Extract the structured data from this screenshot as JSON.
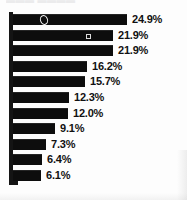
{
  "chart_data": {
    "type": "bar",
    "orientation": "horizontal",
    "title": "",
    "subtitle": "",
    "xlabel": "",
    "ylabel": "",
    "grid": false,
    "legend": null,
    "axis": {
      "spine": "left-vertical",
      "baseline": "bottom",
      "xlim": [
        0,
        24.9
      ],
      "tick_labels": []
    },
    "categories": [
      "",
      "",
      "",
      "",
      "",
      "",
      "",
      "",
      "",
      "",
      ""
    ],
    "values": [
      24.9,
      21.9,
      21.9,
      16.2,
      15.7,
      12.3,
      12.0,
      9.1,
      7.3,
      6.4,
      6.1
    ],
    "data_labels": [
      "24.9%",
      "21.9%",
      "21.9%",
      "16.2%",
      "15.7%",
      "12.3%",
      "12.0%",
      "9.1%",
      "7.3%",
      "6.4%",
      "6.1%"
    ],
    "bar_color": "#0d0d0d",
    "label_color": "#111111",
    "background": "#fdfdfd"
  },
  "artifacts": {
    "ring_label": "scan-artifact-ring",
    "square_label": "scan-artifact-square"
  },
  "title_remnant": {
    "text": "▬▬▬ ▬▬▬▬"
  }
}
